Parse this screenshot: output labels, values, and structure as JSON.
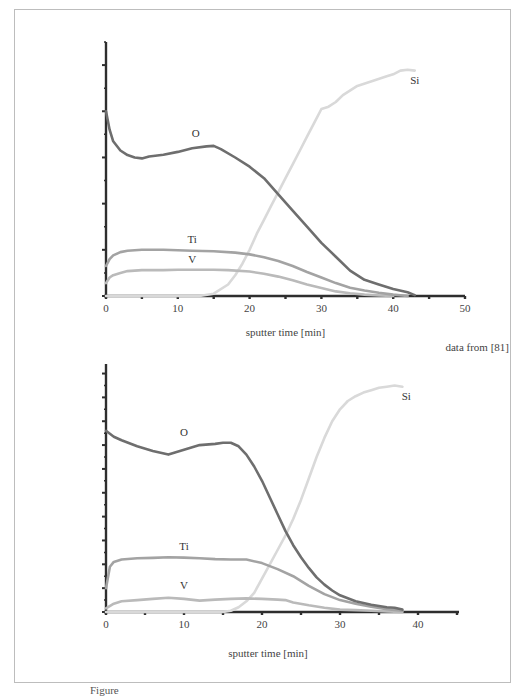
{
  "figure": {
    "credit": "data from [81]",
    "caption": "Figure"
  },
  "chart_data": [
    {
      "type": "line",
      "title": "",
      "xlabel": "sputter time [min]",
      "ylabel": "",
      "xlim": [
        0,
        50
      ],
      "ylim": [
        0,
        5.5
      ],
      "xticks": [
        0,
        10,
        20,
        30,
        40,
        50
      ],
      "yticks_labeled": false,
      "grid": false,
      "legend": "inline labels",
      "series": [
        {
          "name": "O",
          "color": "#6e6e6e",
          "label_at": [
            12.5,
            3.45
          ],
          "x": [
            0,
            0.5,
            1,
            2,
            3,
            4,
            5,
            6,
            8,
            10,
            12,
            14,
            15,
            16,
            18,
            20,
            22,
            24,
            26,
            28,
            30,
            32,
            34,
            36,
            38,
            40,
            42,
            43
          ],
          "y": [
            4.0,
            3.6,
            3.35,
            3.15,
            3.05,
            3.0,
            2.98,
            3.02,
            3.06,
            3.12,
            3.2,
            3.24,
            3.25,
            3.18,
            3.0,
            2.8,
            2.55,
            2.2,
            1.85,
            1.5,
            1.15,
            0.85,
            0.55,
            0.35,
            0.25,
            0.15,
            0.08,
            0.02
          ]
        },
        {
          "name": "Ti",
          "color": "#a3a3a3",
          "label_at": [
            12,
            1.15
          ],
          "x": [
            0,
            0.5,
            1,
            2,
            3,
            5,
            8,
            10,
            12,
            15,
            18,
            20,
            22,
            24,
            26,
            28,
            30,
            32,
            34,
            36,
            38,
            40,
            42
          ],
          "y": [
            0.65,
            0.8,
            0.88,
            0.95,
            0.98,
            1.0,
            1.0,
            0.99,
            0.98,
            0.97,
            0.94,
            0.9,
            0.84,
            0.76,
            0.65,
            0.52,
            0.4,
            0.28,
            0.18,
            0.12,
            0.07,
            0.03,
            0.0
          ]
        },
        {
          "name": "V",
          "color": "#bababa",
          "label_at": [
            12,
            0.72
          ],
          "x": [
            0,
            0.5,
            1,
            2,
            3,
            5,
            8,
            10,
            12,
            15,
            17,
            20,
            22,
            24,
            26,
            28,
            30,
            32,
            34,
            36,
            38,
            40
          ],
          "y": [
            0.28,
            0.4,
            0.45,
            0.5,
            0.54,
            0.56,
            0.56,
            0.57,
            0.57,
            0.57,
            0.56,
            0.53,
            0.48,
            0.42,
            0.34,
            0.25,
            0.17,
            0.1,
            0.06,
            0.03,
            0.01,
            0.0
          ]
        },
        {
          "name": "Si",
          "color": "#d9d9d9",
          "label_at": [
            43,
            4.6
          ],
          "x": [
            0,
            5,
            10,
            13,
            15,
            17,
            18,
            19,
            20,
            21,
            22,
            23,
            24,
            25,
            26,
            27,
            28,
            29,
            30,
            31,
            32,
            33,
            35,
            37,
            39,
            40,
            41,
            42,
            43
          ],
          "y": [
            0.0,
            0.0,
            0.0,
            0.0,
            0.05,
            0.25,
            0.45,
            0.7,
            1.0,
            1.35,
            1.65,
            1.95,
            2.25,
            2.55,
            2.85,
            3.15,
            3.45,
            3.75,
            4.05,
            4.1,
            4.2,
            4.35,
            4.55,
            4.65,
            4.75,
            4.8,
            4.88,
            4.9,
            4.88
          ]
        }
      ]
    },
    {
      "type": "line",
      "title": "",
      "xlabel": "sputter time [min]",
      "ylabel": "",
      "xlim": [
        0,
        45
      ],
      "ylim": [
        0,
        10.4
      ],
      "xticks": [
        0,
        10,
        20,
        30,
        40
      ],
      "yticks_labeled": false,
      "grid": false,
      "legend": "inline labels",
      "series": [
        {
          "name": "O",
          "color": "#6e6e6e",
          "label_at": [
            10,
            7.4
          ],
          "x": [
            0,
            1,
            2,
            4,
            6,
            8,
            10,
            12,
            14,
            15,
            16,
            17,
            18,
            19,
            20,
            21,
            22,
            23,
            24,
            25,
            26,
            27,
            28,
            29,
            30,
            32,
            34,
            36,
            37,
            38
          ],
          "y": [
            7.6,
            7.35,
            7.2,
            6.95,
            6.75,
            6.6,
            6.8,
            7.0,
            7.05,
            7.1,
            7.1,
            6.95,
            6.6,
            6.1,
            5.5,
            4.8,
            4.1,
            3.4,
            2.8,
            2.3,
            1.85,
            1.45,
            1.15,
            0.9,
            0.7,
            0.45,
            0.3,
            0.2,
            0.18,
            0.1
          ]
        },
        {
          "name": "Ti",
          "color": "#a3a3a3",
          "label_at": [
            10,
            2.6
          ],
          "x": [
            0,
            0.5,
            1,
            2,
            4,
            6,
            8,
            10,
            12,
            14,
            16,
            18,
            20,
            22,
            24,
            26,
            28,
            30,
            32,
            34,
            36,
            38
          ],
          "y": [
            1.0,
            1.9,
            2.1,
            2.2,
            2.25,
            2.27,
            2.3,
            2.28,
            2.25,
            2.22,
            2.2,
            2.2,
            2.05,
            1.8,
            1.5,
            1.1,
            0.75,
            0.5,
            0.35,
            0.22,
            0.12,
            0.05
          ]
        },
        {
          "name": "V",
          "color": "#bababa",
          "label_at": [
            10,
            0.95
          ],
          "x": [
            0,
            1,
            2,
            4,
            6,
            8,
            10,
            12,
            14,
            16,
            18,
            20,
            22,
            23,
            24,
            26,
            28,
            30,
            32,
            34,
            36,
            38
          ],
          "y": [
            0.15,
            0.35,
            0.45,
            0.5,
            0.55,
            0.6,
            0.55,
            0.48,
            0.52,
            0.55,
            0.57,
            0.55,
            0.52,
            0.5,
            0.4,
            0.28,
            0.18,
            0.1,
            0.08,
            0.05,
            0.02,
            0.0
          ]
        },
        {
          "name": "Si",
          "color": "#d9d9d9",
          "label_at": [
            38.5,
            8.9
          ],
          "x": [
            0,
            5,
            10,
            15,
            16,
            17,
            18,
            19,
            20,
            21,
            22,
            23,
            24,
            25,
            26,
            27,
            28,
            29,
            30,
            31,
            32,
            33,
            34,
            35,
            36,
            37,
            38
          ],
          "y": [
            0.0,
            0.0,
            0.0,
            0.0,
            0.05,
            0.2,
            0.45,
            0.8,
            1.4,
            2.0,
            2.6,
            3.2,
            3.9,
            4.7,
            5.6,
            6.5,
            7.3,
            8.0,
            8.5,
            8.85,
            9.05,
            9.2,
            9.3,
            9.4,
            9.45,
            9.5,
            9.45
          ]
        }
      ]
    }
  ]
}
